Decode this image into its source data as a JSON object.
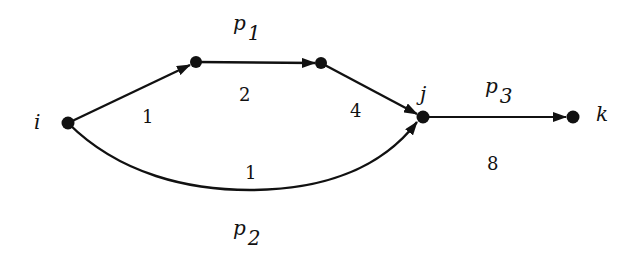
{
  "diagram": {
    "type": "directed-graph",
    "colors": {
      "edge": "#111111",
      "node": "#111111",
      "background": "#ffffff"
    },
    "nodes": [
      {
        "id": "i",
        "label": "i",
        "x": 68,
        "y": 123
      },
      {
        "id": "a",
        "label": "",
        "x": 196,
        "y": 62
      },
      {
        "id": "b",
        "label": "",
        "x": 321,
        "y": 63
      },
      {
        "id": "j",
        "label": "j",
        "x": 423,
        "y": 117
      },
      {
        "id": "k",
        "label": "k",
        "x": 573,
        "y": 117
      }
    ],
    "edges": [
      {
        "from": "i",
        "to": "a",
        "weight": "1",
        "path": "p1"
      },
      {
        "from": "a",
        "to": "b",
        "weight": "2",
        "path": "p1"
      },
      {
        "from": "b",
        "to": "j",
        "weight": "4",
        "path": "p1"
      },
      {
        "from": "i",
        "to": "j",
        "weight": "1",
        "path": "p2",
        "curved": true
      },
      {
        "from": "j",
        "to": "k",
        "weight": "8",
        "path": "p3"
      }
    ],
    "labels": {
      "node_i": "i",
      "node_j": "j",
      "node_k": "k",
      "w_ia": "1",
      "w_ab": "2",
      "w_bj": "4",
      "w_ij_curve": "1",
      "w_jk": "8",
      "p1_base": "p",
      "p1_sub": "1",
      "p2_base": "p",
      "p2_sub": "2",
      "p3_base": "p",
      "p3_sub": "3"
    }
  }
}
